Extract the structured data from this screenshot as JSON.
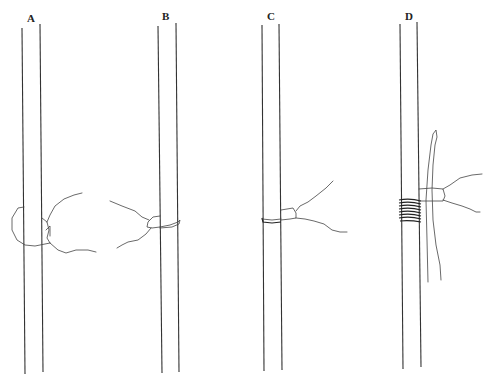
{
  "figure": {
    "type": "line-drawing",
    "panels": [
      {
        "id": "A",
        "label": "A",
        "label_pos": [
          27,
          13
        ]
      },
      {
        "id": "B",
        "label": "B",
        "label_pos": [
          162,
          11
        ]
      },
      {
        "id": "C",
        "label": "C",
        "label_pos": [
          267,
          11
        ]
      },
      {
        "id": "D",
        "label": "D",
        "label_pos": [
          405,
          11
        ]
      }
    ],
    "colors": {
      "background": "#ffffff",
      "line": "#333333"
    }
  }
}
